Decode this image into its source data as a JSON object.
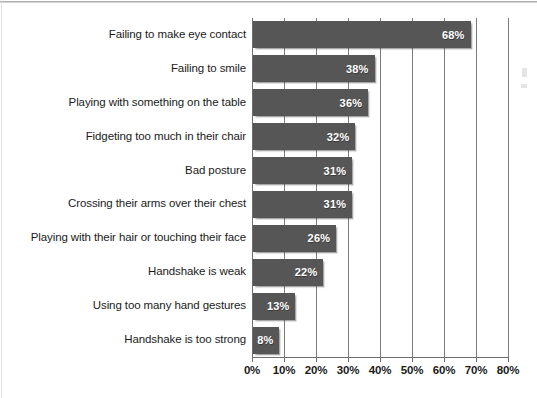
{
  "chart_data": {
    "type": "bar",
    "orientation": "horizontal",
    "title": "",
    "subtitle": "",
    "xlabel": "",
    "ylabel": "",
    "xlim": [
      0,
      80
    ],
    "grid": true,
    "legend": false,
    "categories": [
      "Failing to make eye contact",
      "Failing to smile",
      "Playing with something on the table",
      "Fidgeting too much in their chair",
      "Bad posture",
      "Crossing their arms over their chest",
      "Playing with their hair or touching their face",
      "Handshake is weak",
      "Using too many hand gestures",
      "Handshake is too strong"
    ],
    "values": [
      68,
      38,
      36,
      32,
      31,
      31,
      26,
      22,
      13,
      8
    ],
    "value_labels": [
      "68%",
      "38%",
      "36%",
      "32%",
      "31%",
      "31%",
      "26%",
      "22%",
      "13%",
      "8%"
    ],
    "x_ticks": [
      0,
      10,
      20,
      30,
      40,
      50,
      60,
      70,
      80
    ],
    "x_tick_labels": [
      "0%",
      "10%",
      "20%",
      "30%",
      "40%",
      "50%",
      "60%",
      "70%",
      "80%"
    ],
    "colors": {
      "bar_fill": "#565656",
      "value_label": "#ffffff",
      "category_label": "#1b1b1b",
      "gridline": "#7b7b7b",
      "axis": "#6e6e6e",
      "background": "#ffffff"
    }
  }
}
